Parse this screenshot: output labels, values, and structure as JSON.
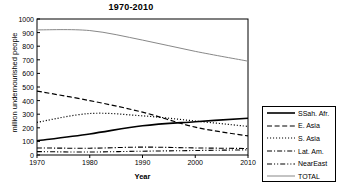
{
  "chart_data": {
    "type": "line",
    "title": "1970-2010",
    "xlabel": "Year",
    "ylabel": "million undernourished people",
    "x": [
      1970,
      1980,
      1990,
      2000,
      2010
    ],
    "xticks": [
      "1970",
      "1980",
      "1990",
      "2000",
      "2010"
    ],
    "yticks": [
      "0",
      "100",
      "200",
      "300",
      "400",
      "500",
      "600",
      "700",
      "800",
      "900",
      "1000"
    ],
    "xlim": [
      1970,
      2010
    ],
    "ylim": [
      0,
      1000
    ],
    "grid": false,
    "legend_position": "right",
    "series": [
      {
        "name": "SSah. Afr.",
        "style": "solid",
        "color": "#000000",
        "width": 1.6,
        "values": [
          105,
          155,
          215,
          245,
          270
        ]
      },
      {
        "name": "E. Asia",
        "style": "dashed",
        "color": "#000000",
        "width": 1.2,
        "values": [
          470,
          400,
          315,
          205,
          140
        ]
      },
      {
        "name": "S. Asia",
        "style": "dotted",
        "color": "#000000",
        "width": 1.2,
        "values": [
          240,
          305,
          288,
          250,
          210
        ]
      },
      {
        "name": "Lat. Am.",
        "style": "dash-dot",
        "color": "#000000",
        "width": 1.1,
        "values": [
          52,
          50,
          58,
          52,
          48
        ]
      },
      {
        "name": "NearEast",
        "style": "dash-dot-dot",
        "color": "#000000",
        "width": 1.1,
        "values": [
          25,
          22,
          28,
          33,
          38
        ]
      },
      {
        "name": "TOTAL",
        "style": "solid",
        "color": "#888888",
        "width": 1.0,
        "values": [
          920,
          915,
          845,
          762,
          690
        ]
      }
    ]
  },
  "legend": {
    "items": [
      {
        "label": "SSah. Afr."
      },
      {
        "label": "E. Asia"
      },
      {
        "label": "S. Asia"
      },
      {
        "label": "Lat. Am."
      },
      {
        "label": "NearEast"
      },
      {
        "label": "TOTAL"
      }
    ]
  }
}
